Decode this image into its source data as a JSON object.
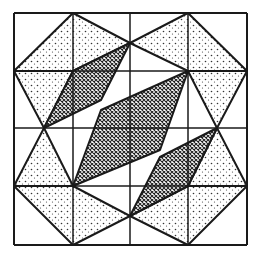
{
  "diagram": {
    "title": "",
    "colors": {
      "line": "#1a1a1a",
      "background": "#ffffff",
      "dot": "#333333",
      "hatch": "#222222"
    },
    "grid": {
      "x": [
        14,
        73,
        130,
        188,
        247
      ],
      "y": [
        13,
        71,
        128,
        186,
        245
      ]
    },
    "dotted_shapes": [
      {
        "name": "top-left-kite",
        "points": "73,13 130,43 73,71 14,71"
      },
      {
        "name": "top-left-triangle",
        "points": "14,71 73,71 44,128"
      },
      {
        "name": "top-right-kite",
        "points": "188,13 247,71 188,71 130,43"
      },
      {
        "name": "top-right-triangle",
        "points": "188,71 247,71 217,128"
      },
      {
        "name": "bottom-left-triangle",
        "points": "14,186 44,128 73,186"
      },
      {
        "name": "bottom-left-kite",
        "points": "14,186 73,186 130,216 73,245"
      },
      {
        "name": "bottom-right-triangle",
        "points": "188,186 217,128 247,186"
      },
      {
        "name": "bottom-right-kite",
        "points": "130,216 188,186 247,186 188,245"
      }
    ],
    "hatched_shapes": [
      {
        "name": "upper-hatched-parallelogram",
        "points": "44,128 73,71 130,43 101,100"
      },
      {
        "name": "center-hatched-parallelogram",
        "points": "73,186 101,110 188,71 160,150"
      },
      {
        "name": "lower-hatched-parallelogram",
        "points": "130,216 160,157 217,128 188,186"
      }
    ]
  }
}
